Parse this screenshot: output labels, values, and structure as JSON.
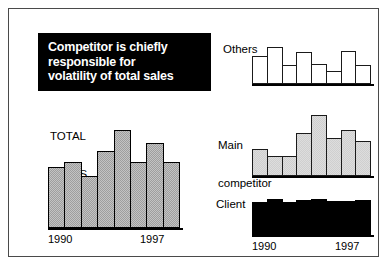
{
  "title_box": {
    "lines": [
      "Competitor is chiefly",
      "responsible for",
      "volatility of total sales"
    ],
    "background": "#000000",
    "text_color": "#ffffff"
  },
  "axis_labels": {
    "start_year": "1990",
    "end_year": "1997"
  },
  "captions": {
    "total_sales_line1": "TOTAL",
    "total_sales_line2": "SALES",
    "others": "Others",
    "main_competitor_line1": "Main",
    "main_competitor_line2": "competitor",
    "client": "Client"
  },
  "chart_data": [
    {
      "type": "bar",
      "name": "total-sales",
      "title": "TOTAL SALES",
      "xlabel": "",
      "ylabel": "",
      "grid": false,
      "legend": "none",
      "categories": [
        "1990",
        "1991",
        "1992",
        "1993",
        "1994",
        "1995",
        "1996",
        "1997"
      ],
      "tick_labels_shown": [
        "1990",
        "1997"
      ],
      "values": [
        0.62,
        0.67,
        0.53,
        0.79,
        1.0,
        0.67,
        0.87,
        0.67
      ],
      "ylim": [
        0,
        1.05
      ],
      "bar_fill": "#9e9e9e",
      "bar_stroke": "#000000"
    },
    {
      "type": "bar",
      "name": "others",
      "title": "Others",
      "xlabel": "",
      "ylabel": "",
      "grid": false,
      "legend": "none",
      "categories": [
        "1990",
        "1991",
        "1992",
        "1993",
        "1994",
        "1995",
        "1996",
        "1997"
      ],
      "tick_labels_shown": [],
      "values": [
        0.75,
        1.0,
        0.5,
        0.85,
        0.55,
        0.35,
        0.9,
        0.5
      ],
      "ylim": [
        0,
        1.05
      ],
      "bar_fill": "#ffffff",
      "bar_stroke": "#1a1a1a"
    },
    {
      "type": "bar",
      "name": "main-competitor",
      "title": "Main competitor",
      "xlabel": "",
      "ylabel": "",
      "grid": false,
      "legend": "none",
      "categories": [
        "1990",
        "1991",
        "1992",
        "1993",
        "1994",
        "1995",
        "1996",
        "1997"
      ],
      "tick_labels_shown": [],
      "values": [
        0.45,
        0.33,
        0.33,
        0.7,
        1.0,
        0.62,
        0.75,
        0.57
      ],
      "ylim": [
        0,
        1.05
      ],
      "bar_fill": "#cfcfcf",
      "bar_stroke": "#1a1a1a"
    },
    {
      "type": "bar",
      "name": "client",
      "title": "Client",
      "xlabel": "",
      "ylabel": "",
      "grid": false,
      "legend": "none",
      "categories": [
        "1990",
        "1991",
        "1992",
        "1993",
        "1994",
        "1995",
        "1996",
        "1997"
      ],
      "tick_labels_shown": [
        "1990",
        "1997"
      ],
      "values": [
        0.92,
        1.0,
        0.92,
        0.97,
        1.0,
        0.95,
        0.95,
        0.97
      ],
      "ylim": [
        0,
        1.05
      ],
      "bar_fill": "#000000",
      "bar_stroke": "#000000"
    }
  ]
}
